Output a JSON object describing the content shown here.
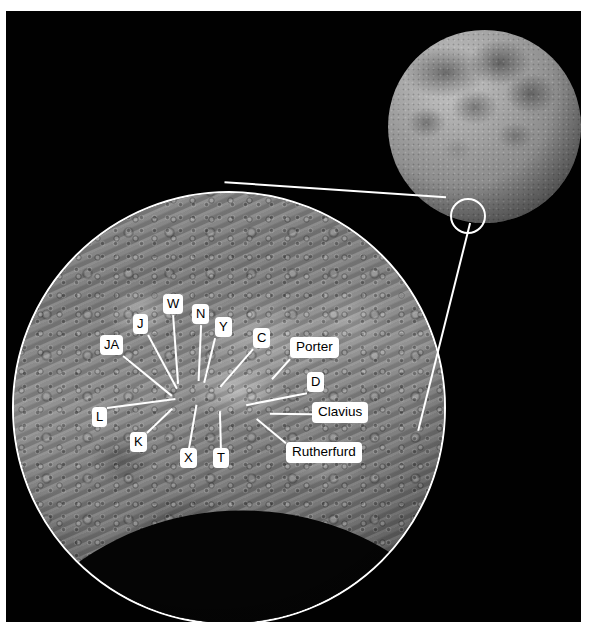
{
  "figure": {
    "background_color": "#ffffff",
    "panel_color": "#010101",
    "annotation_color": "#ffffff",
    "label_text_color": "#000000"
  },
  "moon_thumbnail": {
    "name": "full-moon-disc",
    "locator_circle": {
      "name": "locator-circle",
      "cx": 462,
      "cy": 205,
      "r": 18
    }
  },
  "magnifier": {
    "name": "magnified-inset",
    "cx": 223,
    "cy": 397,
    "r": 217
  },
  "annotations": [
    {
      "id": "JA",
      "label": "JA",
      "kind": "letter",
      "box_x": 100,
      "box_y": 335,
      "tip_x": 172,
      "tip_y": 395
    },
    {
      "id": "J",
      "label": "J",
      "kind": "letter",
      "box_x": 133,
      "box_y": 314,
      "tip_x": 177,
      "tip_y": 388
    },
    {
      "id": "W",
      "label": "W",
      "kind": "letter",
      "box_x": 163,
      "box_y": 294,
      "tip_x": 178,
      "tip_y": 383
    },
    {
      "id": "N",
      "label": "N",
      "kind": "letter",
      "box_x": 192,
      "box_y": 304,
      "tip_x": 198,
      "tip_y": 380
    },
    {
      "id": "Y",
      "label": "Y",
      "kind": "letter",
      "box_x": 215,
      "box_y": 317,
      "tip_x": 204,
      "tip_y": 382
    },
    {
      "id": "C",
      "label": "C",
      "kind": "letter",
      "box_x": 253,
      "box_y": 328,
      "tip_x": 220,
      "tip_y": 386
    },
    {
      "id": "Porter",
      "label": "Porter",
      "kind": "named",
      "box_x": 290,
      "box_y": 337,
      "tip_x": 272,
      "tip_y": 378
    },
    {
      "id": "D",
      "label": "D",
      "kind": "letter",
      "box_x": 307,
      "box_y": 372,
      "tip_x": 246,
      "tip_y": 404
    },
    {
      "id": "Clavius",
      "label": "Clavius",
      "kind": "named",
      "box_x": 312,
      "box_y": 402,
      "tip_x": 270,
      "tip_y": 412
    },
    {
      "id": "Rutherfurd",
      "label": "Rutherfurd",
      "kind": "named",
      "box_x": 286,
      "box_y": 442,
      "tip_x": 257,
      "tip_y": 418
    },
    {
      "id": "L",
      "label": "L",
      "kind": "letter",
      "box_x": 92,
      "box_y": 407,
      "tip_x": 175,
      "tip_y": 398
    },
    {
      "id": "K",
      "label": "K",
      "kind": "letter",
      "box_x": 130,
      "box_y": 432,
      "tip_x": 172,
      "tip_y": 408
    },
    {
      "id": "X",
      "label": "X",
      "kind": "letter",
      "box_x": 180,
      "box_y": 448,
      "tip_x": 196,
      "tip_y": 404
    },
    {
      "id": "T",
      "label": "T",
      "kind": "letter",
      "box_x": 213,
      "box_y": 448,
      "tip_x": 220,
      "tip_y": 410
    }
  ],
  "zoom_leaders": [
    {
      "name": "zoom-leader-upper",
      "x1": 446,
      "y1": 196,
      "x2": 225,
      "y2": 181
    },
    {
      "name": "zoom-leader-lower",
      "x1": 470,
      "y1": 222,
      "x2": 418,
      "y2": 430
    }
  ]
}
